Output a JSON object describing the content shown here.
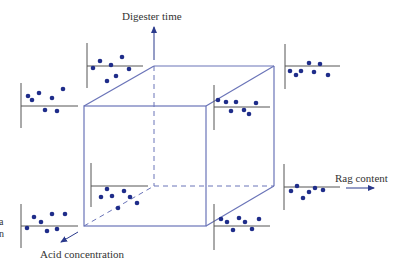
{
  "colors": {
    "cube_line": "#6a74b8",
    "axis_line": "#555555",
    "dot": "#1f2d8a",
    "arrow": "#2b3a8c",
    "text": "#333333"
  },
  "axes": {
    "digester_time": {
      "label": "Digester time"
    },
    "rag_content": {
      "label": "Rag content"
    },
    "acid_concentration": {
      "label": "Acid concentration"
    }
  },
  "left_edge_fragments": [
    "a",
    "n"
  ],
  "cube": {
    "front": {
      "x1": 84,
      "y1": 106,
      "x2": 206,
      "y2": 226
    },
    "back": {
      "x1": 154,
      "y1": 66,
      "x2": 274,
      "y2": 186
    }
  },
  "scatter_plots": [
    {
      "id": "top-left",
      "vx": 21,
      "vy1": 83,
      "vy2": 128,
      "hx1": 21,
      "hx2": 78,
      "hy": 106,
      "dots": [
        [
          28,
          96
        ],
        [
          32,
          100
        ],
        [
          39,
          93
        ],
        [
          45,
          110
        ],
        [
          52,
          98
        ],
        [
          57,
          111
        ],
        [
          63,
          89
        ]
      ]
    },
    {
      "id": "top-center",
      "vx": 87,
      "vy1": 43,
      "vy2": 88,
      "hx1": 87,
      "hx2": 143,
      "hy": 66,
      "dots": [
        [
          93,
          68
        ],
        [
          100,
          61
        ],
        [
          107,
          81
        ],
        [
          111,
          65
        ],
        [
          116,
          76
        ],
        [
          122,
          57
        ],
        [
          129,
          69
        ]
      ]
    },
    {
      "id": "top-right",
      "vx": 285,
      "vy1": 44,
      "vy2": 89,
      "hx1": 285,
      "hx2": 340,
      "hy": 66,
      "dots": [
        [
          290,
          71
        ],
        [
          296,
          75
        ],
        [
          301,
          71
        ],
        [
          309,
          63
        ],
        [
          314,
          72
        ],
        [
          320,
          64
        ],
        [
          328,
          75
        ]
      ]
    },
    {
      "id": "right-mid",
      "vx": 214,
      "vy1": 85,
      "vy2": 130,
      "hx1": 214,
      "hx2": 270,
      "hy": 107,
      "dots": [
        [
          218,
          100
        ],
        [
          226,
          102
        ],
        [
          231,
          111
        ],
        [
          236,
          102
        ],
        [
          244,
          110
        ],
        [
          249,
          114
        ],
        [
          256,
          103
        ]
      ]
    },
    {
      "id": "center-low",
      "vx": 91,
      "vy1": 163,
      "vy2": 207,
      "hx1": 91,
      "hx2": 148,
      "hy": 186,
      "dots": [
        [
          101,
          197
        ],
        [
          107,
          189
        ],
        [
          112,
          196
        ],
        [
          118,
          208
        ],
        [
          124,
          191
        ],
        [
          130,
          197
        ],
        [
          137,
          203
        ]
      ]
    },
    {
      "id": "right-low",
      "vx": 284,
      "vy1": 164,
      "vy2": 210,
      "hx1": 284,
      "hx2": 340,
      "hy": 187,
      "dots": [
        [
          291,
          191
        ],
        [
          297,
          186
        ],
        [
          303,
          198
        ],
        [
          309,
          192
        ],
        [
          315,
          188
        ],
        [
          323,
          190
        ]
      ]
    },
    {
      "id": "bottom-left",
      "vx": 21,
      "vy1": 204,
      "vy2": 248,
      "hx1": 21,
      "hx2": 78,
      "hy": 226,
      "dots": [
        [
          27,
          228
        ],
        [
          34,
          217
        ],
        [
          41,
          222
        ],
        [
          47,
          231
        ],
        [
          52,
          214
        ],
        [
          57,
          229
        ],
        [
          65,
          214
        ]
      ]
    },
    {
      "id": "bottom-right",
      "vx": 214,
      "vy1": 204,
      "vy2": 250,
      "hx1": 214,
      "hx2": 270,
      "hy": 226,
      "dots": [
        [
          221,
          219
        ],
        [
          227,
          222
        ],
        [
          233,
          230
        ],
        [
          239,
          218
        ],
        [
          245,
          222
        ],
        [
          252,
          229
        ],
        [
          259,
          219
        ]
      ]
    }
  ]
}
